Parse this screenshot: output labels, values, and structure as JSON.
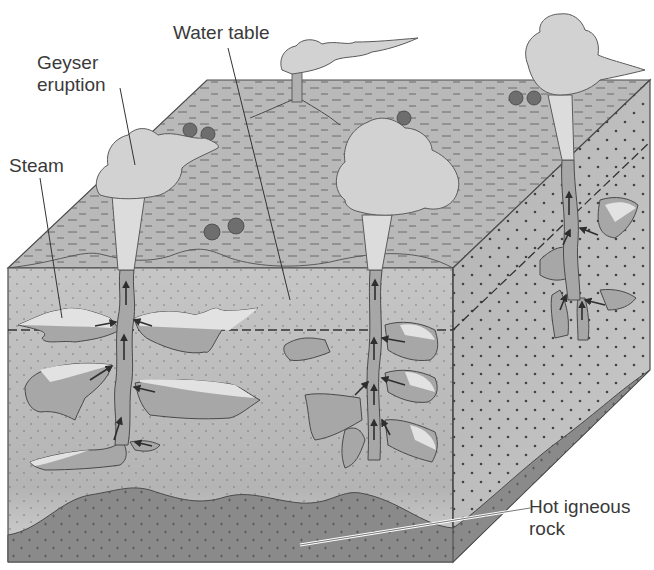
{
  "figure": {
    "labels": {
      "geyser_eruption": "Geyser\neruption",
      "water_table": "Water table",
      "steam": "Steam",
      "hot_igneous_rock": "Hot igneous\nrock"
    },
    "colors": {
      "surface": "#b9b9b9",
      "front_face": "#c8c8c8",
      "right_face": "#b0b0b0",
      "igneous_rock": "#8a8a8a",
      "water_pocket": "#a7a7a7",
      "steam_pocket": "#e2e2e2",
      "cloud": "#d2d2d2",
      "tree": "#6e6e6e",
      "outline": "#4a4a4a",
      "label_text": "#3a3a3a"
    },
    "features": {
      "geysers": [
        "left-front geyser",
        "center geyser",
        "right-back geyser"
      ],
      "volcano": "distant steaming vent",
      "water_table_line": "dashed",
      "flow_arrows": "upward arrows in conduits"
    }
  }
}
